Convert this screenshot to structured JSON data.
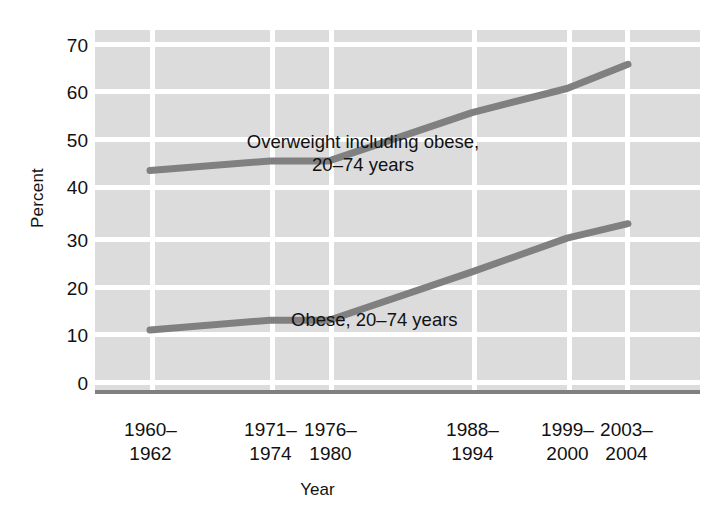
{
  "chart_data": {
    "type": "line",
    "title": "",
    "subtitle": "",
    "xlabel": "Year",
    "ylabel": "Percent",
    "ylim": [
      0,
      70
    ],
    "ytick_step": 10,
    "yticks": [
      "70",
      "60",
      "50",
      "40",
      "30",
      "20",
      "10",
      "0"
    ],
    "grid": true,
    "grid_color": "#ffffff",
    "plot_background": "#dcdcdc",
    "legend_position": "inline-annotations",
    "categories": [
      "1960–\n1962",
      "1971–\n1974",
      "1976–\n1980",
      "1988–\n1994",
      "1999–\n2000",
      "2003–\n2004"
    ],
    "categories_flat": [
      "1960–1962",
      "1971–1974",
      "1976–1980",
      "1988–1994",
      "1999–2000",
      "2003–2004"
    ],
    "series": [
      {
        "name": "Overweight including obese, 20–74 years",
        "color": "#808080",
        "values": [
          44,
          46,
          46,
          56,
          61,
          66
        ]
      },
      {
        "name": "Obese, 20–74 years",
        "color": "#808080",
        "values": [
          11,
          13,
          13,
          23,
          30,
          33
        ]
      }
    ],
    "annotations": [
      {
        "id": "overweight",
        "text": "Overweight including obese,\n20–74 years"
      },
      {
        "id": "obese",
        "text": "Obese, 20–74 years"
      }
    ]
  },
  "axes": {
    "y_title": "Percent",
    "x_title": "Year"
  },
  "colors": {
    "line": "#808080",
    "plot_bg": "#dcdcdc",
    "grid": "#ffffff",
    "axis": "#808080",
    "text": "#111111"
  }
}
